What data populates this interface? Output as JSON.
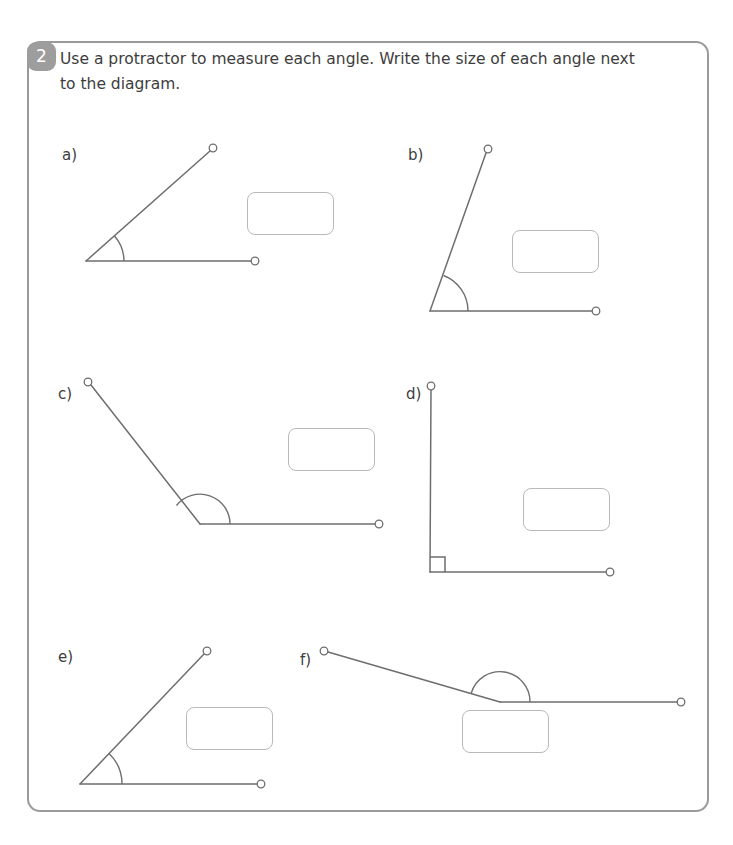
{
  "worksheet": {
    "question_number": "2",
    "instruction": "Use a protractor to measure each angle. Write the size of each angle next to the diagram.",
    "accent_color": "#9d9d9d",
    "line_color": "#6e6e6e",
    "box_border_color": "#b9b9b9",
    "frame_color": "#9a9a9a"
  },
  "parts": [
    {
      "label": "a)",
      "label_pos": {
        "x": 62,
        "y": 146
      },
      "angle_type": "acute",
      "vertex": {
        "x": 86,
        "y": 261
      },
      "rays": [
        {
          "name": "horizontal-ray",
          "x": 255,
          "y": 261
        },
        {
          "name": "slanted-ray",
          "x": 213,
          "y": 148
        }
      ],
      "arc_radius": 38,
      "answer_box": {
        "x": 247,
        "y": 192,
        "w": 87,
        "h": 43
      },
      "answer_value": ""
    },
    {
      "label": "b)",
      "label_pos": {
        "x": 408,
        "y": 146
      },
      "angle_type": "acute",
      "vertex": {
        "x": 430,
        "y": 311
      },
      "rays": [
        {
          "name": "horizontal-ray",
          "x": 596,
          "y": 311
        },
        {
          "name": "steep-ray",
          "x": 488,
          "y": 150
        }
      ],
      "arc_radius": 38,
      "answer_box": {
        "x": 512,
        "y": 230,
        "w": 87,
        "h": 43
      },
      "answer_value": ""
    },
    {
      "label": "c)",
      "label_pos": {
        "x": 58,
        "y": 385
      },
      "angle_type": "obtuse",
      "vertex": {
        "x": 200,
        "y": 524
      },
      "rays": [
        {
          "name": "horizontal-ray",
          "x": 379,
          "y": 524
        },
        {
          "name": "upper-left-ray",
          "x": 88,
          "y": 382
        }
      ],
      "arc_radius": 30,
      "answer_box": {
        "x": 288,
        "y": 428,
        "w": 87,
        "h": 43
      },
      "answer_value": ""
    },
    {
      "label": "d)",
      "label_pos": {
        "x": 406,
        "y": 385
      },
      "angle_type": "right",
      "vertex": {
        "x": 430,
        "y": 572
      },
      "rays": [
        {
          "name": "horizontal-ray",
          "x": 610,
          "y": 572
        },
        {
          "name": "vertical-ray",
          "x": 431,
          "y": 386
        }
      ],
      "right_angle_marker_size": 15,
      "answer_box": {
        "x": 523,
        "y": 488,
        "w": 87,
        "h": 43
      },
      "answer_value": ""
    },
    {
      "label": "e)",
      "label_pos": {
        "x": 58,
        "y": 648
      },
      "angle_type": "acute",
      "vertex": {
        "x": 80,
        "y": 784
      },
      "rays": [
        {
          "name": "horizontal-ray",
          "x": 261,
          "y": 784
        },
        {
          "name": "slanted-ray",
          "x": 207,
          "y": 651
        }
      ],
      "arc_radius": 42,
      "answer_box": {
        "x": 186,
        "y": 707,
        "w": 87,
        "h": 43
      },
      "answer_value": ""
    },
    {
      "label": "f)",
      "label_pos": {
        "x": 300,
        "y": 651
      },
      "angle_type": "obtuse",
      "vertex": {
        "x": 500,
        "y": 702
      },
      "rays": [
        {
          "name": "horizontal-ray",
          "x": 681,
          "y": 702
        },
        {
          "name": "upper-left-ray",
          "x": 324,
          "y": 651
        }
      ],
      "arc_radius": 30,
      "answer_box": {
        "x": 462,
        "y": 710,
        "w": 87,
        "h": 43
      },
      "answer_value": ""
    }
  ]
}
